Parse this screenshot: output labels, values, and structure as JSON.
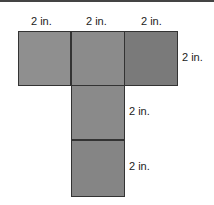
{
  "diagram": {
    "type": "net",
    "labels": {
      "top_1": "2 in.",
      "top_2": "2 in.",
      "top_3": "2 in.",
      "right_row": "2 in.",
      "middle_square": "2 in.",
      "bottom_square": "2 in."
    },
    "colors": {
      "square_1": "#8f8f8f",
      "square_2": "#8b8b8b",
      "square_3": "#7a7a7a",
      "square_4": "#8a8a8a",
      "square_5": "#858585"
    }
  }
}
